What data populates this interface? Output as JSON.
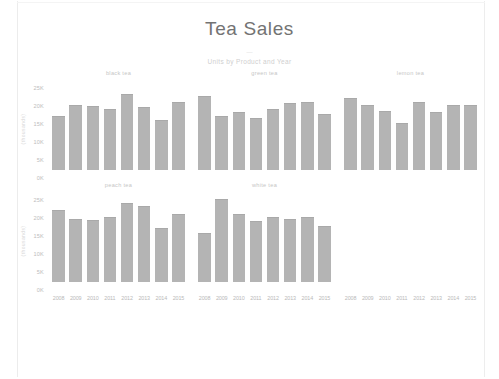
{
  "header": {
    "title": "Tea Sales",
    "subtitle": "Units by Product and Year",
    "subtitle_dash": "—"
  },
  "axes": {
    "y_title": "(thousands)",
    "y_ticks": [
      "25K",
      "20K",
      "15K",
      "10K",
      "5K",
      "0K"
    ],
    "y_min": 0,
    "y_max": 25000,
    "x_ticks": [
      "2008",
      "2009",
      "2010",
      "2011",
      "2012",
      "2013",
      "2014",
      "2015"
    ]
  },
  "colors": {
    "bar": "#b4b4b4",
    "title": "#737373",
    "axis_text": "#bdbdbd",
    "panel_title": "#c6c6c6",
    "background": "#ffffff"
  },
  "chart_data": {
    "type": "bar",
    "title": "Tea Sales",
    "subtitle": "Units by Product and Year",
    "xlabel": "",
    "ylabel": "(thousands)",
    "ylim": [
      0,
      25000
    ],
    "yticks": [
      0,
      5000,
      10000,
      15000,
      20000,
      25000
    ],
    "grid": false,
    "legend": "none",
    "layout": "small-multiples 3 columns x 2 rows",
    "categories": [
      "2008",
      "2009",
      "2010",
      "2011",
      "2012",
      "2013",
      "2014",
      "2015"
    ],
    "panels": [
      {
        "name": "black tea",
        "row": 0,
        "col": 0,
        "values": [
          15000,
          18000,
          17800,
          17000,
          21000,
          17500,
          14000,
          19000
        ]
      },
      {
        "name": "green tea",
        "row": 0,
        "col": 1,
        "values": [
          20500,
          15000,
          16000,
          14500,
          17000,
          18500,
          19000,
          15500
        ]
      },
      {
        "name": "lemon tea",
        "row": 0,
        "col": 2,
        "values": [
          20000,
          18000,
          16500,
          13000,
          19000,
          16000,
          18000,
          18000
        ]
      },
      {
        "name": "peach tea",
        "row": 1,
        "col": 0,
        "values": [
          20000,
          17500,
          17300,
          18000,
          22000,
          21000,
          15000,
          19000
        ]
      },
      {
        "name": "white tea",
        "row": 1,
        "col": 1,
        "values": [
          13500,
          23000,
          19000,
          17000,
          18000,
          17500,
          18000,
          15500
        ]
      }
    ]
  }
}
